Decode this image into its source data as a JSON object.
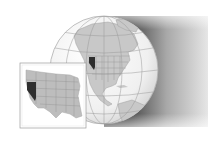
{
  "figure": {
    "type": "locator-map",
    "highlighted_region": "Nevada",
    "globe": {
      "region_shown": "North America",
      "center": [
        104,
        70
      ],
      "radius": 54,
      "land_color": "#c8c8c8",
      "ocean_color": "#f2f2f2",
      "graticule_color": "#9a9a9a"
    },
    "inset": {
      "region_shown": "Western United States",
      "box": [
        20,
        63,
        66,
        65
      ],
      "border_color": "#9c9c9c",
      "land_color": "#bdbdbd"
    },
    "colors": {
      "highlight": "#2e2e2e",
      "shadow_dark": "#3a3a3a",
      "shadow_light": "#e8e8e8",
      "background": "#ffffff"
    }
  }
}
